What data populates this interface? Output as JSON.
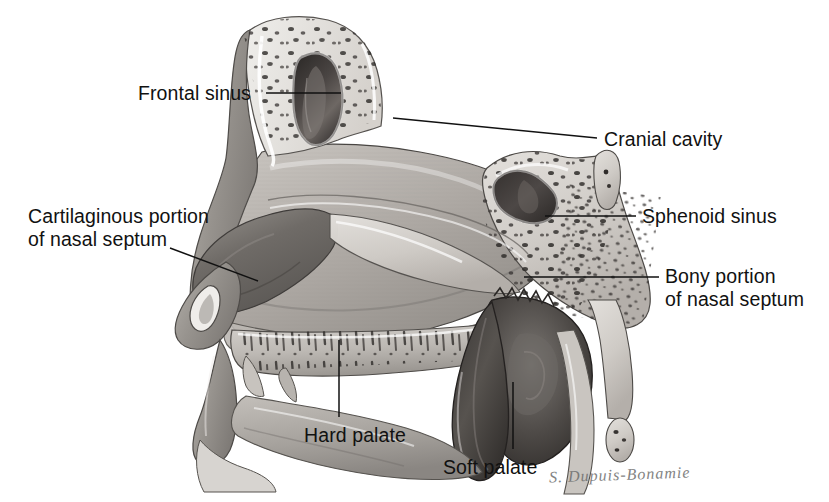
{
  "figure": {
    "style": "grayscale pencil anatomical illustration",
    "background_color": "#ffffff",
    "line_color": "#111111",
    "signature": "S. Dupuis-Bonamie"
  },
  "labels": [
    {
      "id": "frontal-sinus",
      "text": "Frontal sinus",
      "x": 138,
      "y": 82,
      "align": "left",
      "leader": {
        "type": "line",
        "x1": 266,
        "y1": 93,
        "x2": 341,
        "y2": 93
      }
    },
    {
      "id": "cranial-cavity",
      "text": "Cranial cavity",
      "x": 604,
      "y": 128,
      "align": "left",
      "leader": {
        "type": "line",
        "x1": 393,
        "y1": 118,
        "x2": 597,
        "y2": 138
      }
    },
    {
      "id": "cartilaginous-portion-of-nasal-septum",
      "text": "Cartilaginous portion\nof nasal septum",
      "x": 28,
      "y": 205,
      "align": "left",
      "leader": {
        "type": "line",
        "x1": 170,
        "y1": 248,
        "x2": 258,
        "y2": 281
      }
    },
    {
      "id": "sphenoid-sinus",
      "text": "Sphenoid sinus",
      "x": 642,
      "y": 205,
      "align": "left",
      "leader": {
        "type": "line",
        "x1": 545,
        "y1": 216,
        "x2": 636,
        "y2": 216
      }
    },
    {
      "id": "bony-portion-of-nasal-septum",
      "text": "Bony portion\nof nasal septum",
      "x": 665,
      "y": 265,
      "align": "left",
      "leader": {
        "type": "line",
        "x1": 524,
        "y1": 277,
        "x2": 659,
        "y2": 277
      }
    },
    {
      "id": "hard-palate",
      "text": "Hard palate",
      "x": 304,
      "y": 424,
      "align": "left",
      "leader": {
        "type": "line",
        "x1": 339,
        "y1": 340,
        "x2": 339,
        "y2": 417
      }
    },
    {
      "id": "soft-palate",
      "text": "Soft palate",
      "x": 443,
      "y": 456,
      "align": "left",
      "leader": {
        "type": "line",
        "x1": 513,
        "y1": 382,
        "x2": 513,
        "y2": 449
      }
    }
  ],
  "structures": [
    {
      "id": "frontal-sinus-cavity",
      "name": "frontal sinus cavity",
      "tone": "#3b3b3b"
    },
    {
      "id": "sphenoid-sinus-cavity",
      "name": "sphenoid sinus cavity",
      "tone": "#3a3a3a"
    },
    {
      "id": "cartilaginous-septum",
      "name": "cartilaginous portion of nasal septum",
      "tone": "#6e6e6e"
    },
    {
      "id": "bony-septum",
      "name": "bony portion of nasal septum (diploic bone)",
      "tone": "#cfcbc6"
    },
    {
      "id": "hard-palate-bone",
      "name": "hard palate",
      "tone": "#b9b5b0"
    },
    {
      "id": "soft-palate-flap",
      "name": "soft palate",
      "tone": "#4a4746"
    },
    {
      "id": "cranial-cavity-region",
      "name": "cranial cavity",
      "tone": "#a9a5a1"
    },
    {
      "id": "nasopharynx",
      "name": "nasopharynx",
      "tone": "#524f4d"
    },
    {
      "id": "tongue-floor",
      "name": "floor of oral cavity / tongue",
      "tone": "#8b8884"
    },
    {
      "id": "external-nose",
      "name": "external nose",
      "tone": "#9a9792"
    }
  ]
}
